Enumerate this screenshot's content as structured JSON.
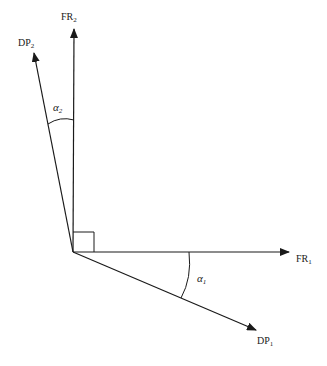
{
  "diagram": {
    "type": "vector-angle-diagram",
    "stroke_color": "#1a1a1a",
    "background": "#ffffff",
    "origin": {
      "x": 73,
      "y": 252
    },
    "vectors": [
      {
        "id": "FR1",
        "label_main": "FR",
        "label_sub": "1",
        "tip": {
          "x": 289,
          "y": 252
        }
      },
      {
        "id": "FR2",
        "label_main": "FR",
        "label_sub": "2",
        "tip": {
          "x": 74,
          "y": 29
        }
      },
      {
        "id": "DP1",
        "label_main": "DP",
        "label_sub": "1",
        "tip": {
          "x": 256,
          "y": 330
        }
      },
      {
        "id": "DP2",
        "label_main": "DP",
        "label_sub": "2",
        "tip": {
          "x": 34,
          "y": 53
        }
      }
    ],
    "angles": [
      {
        "id": "alpha1",
        "symbol": "α",
        "sub": "1",
        "between": [
          "FR1",
          "DP1"
        ]
      },
      {
        "id": "alpha2",
        "symbol": "α",
        "sub": "2",
        "between": [
          "FR2",
          "DP2"
        ]
      }
    ],
    "right_angle_marker": {
      "between": [
        "FR1",
        "FR2"
      ],
      "size": 21
    }
  }
}
